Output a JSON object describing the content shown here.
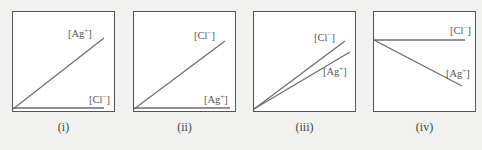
{
  "panels": [
    {
      "caption": "(i)",
      "lines": [
        {
          "name": "[Ag⁺]",
          "ion": "Ag",
          "charge": "+",
          "from": [
            0,
            100
          ],
          "to": [
            91,
            26
          ],
          "label_pos": [
            57,
            22
          ]
        },
        {
          "name": "[Cl⁻]",
          "ion": "Cl",
          "charge": "−",
          "from": [
            0,
            98
          ],
          "to": [
            91,
            98
          ],
          "label_pos": [
            76,
            83
          ]
        }
      ]
    },
    {
      "caption": "(ii)",
      "lines": [
        {
          "name": "[Cl⁻]",
          "ion": "Cl",
          "charge": "−",
          "from": [
            0,
            99
          ],
          "to": [
            91,
            30
          ],
          "label_pos": [
            60,
            24
          ]
        },
        {
          "name": "[Ag⁺]",
          "ion": "Ag",
          "charge": "+",
          "from": [
            0,
            98
          ],
          "to": [
            96,
            98
          ],
          "label_pos": [
            70,
            83
          ]
        }
      ]
    },
    {
      "caption": "(iii)",
      "lines": [
        {
          "name": "[Cl⁻]",
          "ion": "Cl",
          "charge": "−",
          "from": [
            0,
            100
          ],
          "to": [
            91,
            30
          ],
          "label_pos": [
            59,
            26
          ]
        },
        {
          "name": "[Ag⁺]",
          "ion": "Ag",
          "charge": "+",
          "from": [
            0,
            100
          ],
          "to": [
            96,
            42
          ],
          "label_pos": [
            70,
            60
          ]
        }
      ]
    },
    {
      "caption": "(iv)",
      "lines": [
        {
          "name": "[Cl⁻]",
          "ion": "Cl",
          "charge": "−",
          "from": [
            0,
            29
          ],
          "to": [
            91,
            29
          ],
          "label_pos": [
            75,
            14
          ]
        },
        {
          "name": "[Ag⁺]",
          "ion": "Ag",
          "charge": "+",
          "from": [
            0,
            29
          ],
          "to": [
            88,
            75
          ],
          "label_pos": [
            72,
            56
          ]
        }
      ]
    }
  ],
  "colors": {
    "background": "#f1f1f0",
    "panel": "#ffffff",
    "line": "#6e6e6e",
    "border": "#555555",
    "text": "#555555"
  }
}
